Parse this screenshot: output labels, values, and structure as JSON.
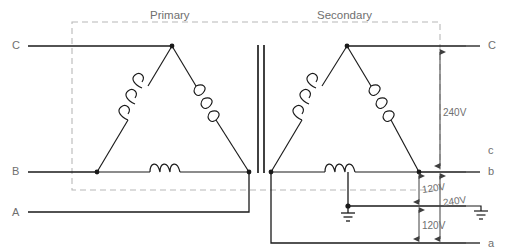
{
  "diagram": {
    "kind": "electrical-schematic",
    "colors": {
      "wire": "#1a1a1a",
      "dashed_box": "#b8b8b8",
      "text": "#6f6f6f",
      "dimension": "#5a5a5a",
      "background": "#ffffff"
    },
    "sections": {
      "primary_title": "Primary",
      "secondary_title": "Secondary"
    },
    "terminals_left": [
      {
        "label": "C",
        "x": 14,
        "y": 45
      },
      {
        "label": "B",
        "x": 14,
        "y": 171
      },
      {
        "label": "A",
        "x": 14,
        "y": 212
      }
    ],
    "terminals_right": [
      {
        "label": "C",
        "x": 489,
        "y": 45
      },
      {
        "label": "c",
        "x": 489,
        "y": 150
      },
      {
        "label": "b",
        "x": 489,
        "y": 171
      },
      {
        "label": "a",
        "x": 489,
        "y": 243
      }
    ],
    "dimensions": [
      {
        "label": "240V",
        "from": "C",
        "to": "b",
        "x": 447,
        "y": 113
      },
      {
        "label": "120V",
        "from": "b",
        "to": "center-tap",
        "x": 426,
        "y": 190
      },
      {
        "label": "240V",
        "from": "b",
        "to": "a",
        "x": 448,
        "y": 203
      },
      {
        "label": "120V",
        "from": "center-tap",
        "to": "a",
        "x": 426,
        "y": 226
      }
    ],
    "symbols": {
      "transformer_core": "core-bars",
      "center_tap_ground": "earth-ground",
      "right_ground": "earth-ground",
      "coil": "winding-coil"
    },
    "windings": {
      "primary_count": 3,
      "secondary_count": 3
    }
  }
}
